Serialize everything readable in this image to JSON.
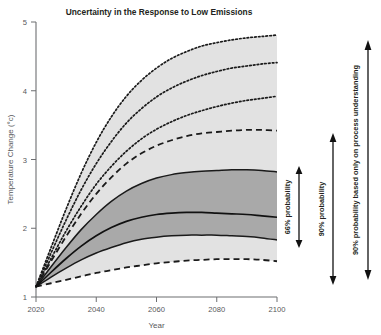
{
  "chart_data": {
    "type": "line",
    "title": "Uncertainty in the Response to Low Emissions",
    "xlabel": "Year",
    "ylabel": "Temperature Change (°c)",
    "xlim": [
      2020,
      2100
    ],
    "ylim": [
      1,
      5
    ],
    "xticks": [
      "2020",
      "2040",
      "2060",
      "2080",
      "2100"
    ],
    "yticks": [
      "1",
      "2",
      "3",
      "4",
      "5"
    ],
    "grid": false,
    "legend_position": "none",
    "x": [
      2020,
      2025,
      2030,
      2035,
      2040,
      2045,
      2050,
      2055,
      2060,
      2065,
      2070,
      2075,
      2080,
      2085,
      2090,
      2095,
      2100
    ],
    "series": [
      {
        "name": "Median (best estimate)",
        "style": "solid",
        "values": [
          1.15,
          1.36,
          1.56,
          1.74,
          1.89,
          2.01,
          2.1,
          2.16,
          2.2,
          2.22,
          2.23,
          2.23,
          2.22,
          2.21,
          2.2,
          2.18,
          2.16
        ]
      },
      {
        "name": "66% probability lower bound",
        "style": "solid",
        "values": [
          1.15,
          1.29,
          1.42,
          1.54,
          1.64,
          1.72,
          1.79,
          1.84,
          1.87,
          1.89,
          1.9,
          1.9,
          1.9,
          1.89,
          1.88,
          1.86,
          1.83
        ]
      },
      {
        "name": "66% probability upper bound",
        "style": "solid",
        "values": [
          1.15,
          1.44,
          1.72,
          1.98,
          2.2,
          2.39,
          2.54,
          2.65,
          2.73,
          2.78,
          2.81,
          2.83,
          2.84,
          2.85,
          2.85,
          2.84,
          2.82
        ]
      },
      {
        "name": "90% probability lower bound",
        "style": "dashed",
        "values": [
          1.15,
          1.2,
          1.25,
          1.3,
          1.35,
          1.39,
          1.43,
          1.46,
          1.49,
          1.51,
          1.53,
          1.54,
          1.55,
          1.55,
          1.55,
          1.54,
          1.52
        ]
      },
      {
        "name": "90% probability upper bound",
        "style": "dashed",
        "values": [
          1.15,
          1.52,
          1.88,
          2.21,
          2.5,
          2.74,
          2.94,
          3.09,
          3.2,
          3.28,
          3.34,
          3.38,
          3.4,
          3.42,
          3.43,
          3.43,
          3.42
        ]
      },
      {
        "name": "Process-understanding band lower",
        "style": "dotted",
        "values": [
          1.15,
          1.56,
          1.96,
          2.32,
          2.64,
          2.9,
          3.12,
          3.3,
          3.44,
          3.55,
          3.64,
          3.71,
          3.77,
          3.82,
          3.86,
          3.89,
          3.92
        ]
      },
      {
        "name": "Process-understanding band middle",
        "style": "dotted",
        "values": [
          1.15,
          1.64,
          2.12,
          2.56,
          2.94,
          3.26,
          3.53,
          3.74,
          3.91,
          4.04,
          4.14,
          4.22,
          4.28,
          4.33,
          4.36,
          4.39,
          4.41
        ]
      },
      {
        "name": "Process-understanding band upper",
        "style": "dotted",
        "values": [
          1.15,
          1.72,
          2.28,
          2.8,
          3.25,
          3.62,
          3.92,
          4.15,
          4.33,
          4.47,
          4.57,
          4.65,
          4.7,
          4.74,
          4.77,
          4.79,
          4.81
        ]
      }
    ],
    "bands": [
      {
        "name": "66% probability band",
        "fill": "#a9a9a9",
        "lower_series": "66% probability lower bound",
        "upper_series": "66% probability upper bound"
      },
      {
        "name": "Process understanding band",
        "fill": "#e2e2e2",
        "lower_series": "90% probability lower bound",
        "upper_series": "Process-understanding band upper"
      }
    ],
    "annotations": [
      {
        "label": "66% probability",
        "from_value": 1.83,
        "to_value": 2.82
      },
      {
        "label": "90% probability",
        "from_value": 1.52,
        "to_value": 3.42
      },
      {
        "label": "90% probability based only on process understanding",
        "from_value": 1.3,
        "to_value": 4.81
      }
    ]
  },
  "colors": {
    "band_inner": "#a9a9a9",
    "band_outer": "#e2e2e2",
    "line": "#1a1a1a",
    "axis": "#6d6e71",
    "tick_text": "#58585b",
    "title_text": "#231f20"
  }
}
